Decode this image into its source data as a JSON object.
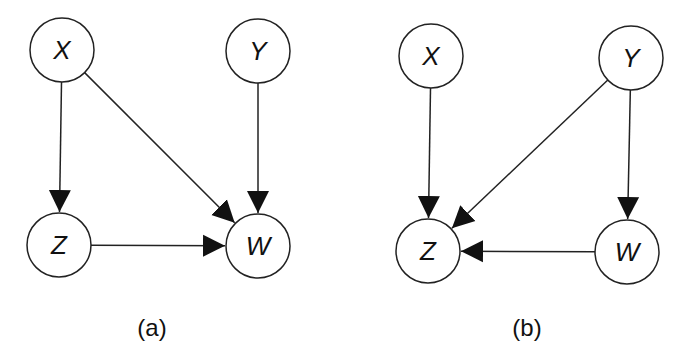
{
  "diagrams": [
    {
      "caption": "(a)",
      "nodes": [
        {
          "id": "X",
          "label": "X",
          "x": 62,
          "y": 50
        },
        {
          "id": "Y",
          "label": "Y",
          "x": 258,
          "y": 51
        },
        {
          "id": "Z",
          "label": "Z",
          "x": 59,
          "y": 245
        },
        {
          "id": "W",
          "label": "W",
          "x": 258,
          "y": 246
        }
      ],
      "edges": [
        {
          "from": "X",
          "to": "Z"
        },
        {
          "from": "X",
          "to": "W"
        },
        {
          "from": "Y",
          "to": "W"
        },
        {
          "from": "Z",
          "to": "W"
        }
      ],
      "caption_pos": {
        "x": 152,
        "y": 336
      }
    },
    {
      "caption": "(b)",
      "nodes": [
        {
          "id": "X",
          "label": "X",
          "x": 431,
          "y": 56
        },
        {
          "id": "Y",
          "label": "Y",
          "x": 631,
          "y": 58
        },
        {
          "id": "Z",
          "label": "Z",
          "x": 428,
          "y": 251
        },
        {
          "id": "W",
          "label": "W",
          "x": 627,
          "y": 252
        }
      ],
      "edges": [
        {
          "from": "X",
          "to": "Z"
        },
        {
          "from": "Y",
          "to": "Z"
        },
        {
          "from": "Y",
          "to": "W"
        },
        {
          "from": "W",
          "to": "Z"
        }
      ],
      "caption_pos": {
        "x": 527,
        "y": 336
      }
    }
  ],
  "style": {
    "node_radius": 32,
    "stroke": "#222222",
    "background": "#ffffff"
  }
}
